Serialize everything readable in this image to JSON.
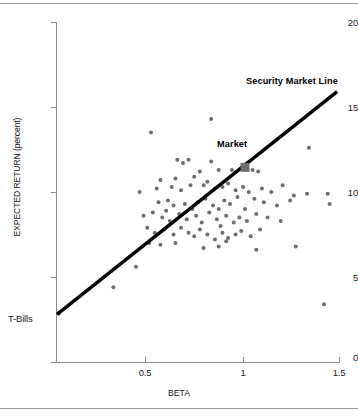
{
  "chart_data": {
    "type": "scatter",
    "title": "",
    "xlabel": "BETA",
    "ylabel": "EXPECTED RETURN (percent)",
    "xlim": [
      0,
      1.51
    ],
    "ylim": [
      0,
      20
    ],
    "xticks": [
      0.5,
      1,
      1.5
    ],
    "xticklabels": [
      "0.5",
      "1",
      "1.5"
    ],
    "yticks": [
      0,
      5,
      10,
      15,
      20
    ],
    "yticklabels": [
      "0",
      "5",
      "10",
      "15",
      "20"
    ],
    "grid": false,
    "legend": "none",
    "annotations": [
      {
        "text": "Security Market Line",
        "x": 1.05,
        "y": 16.9
      },
      {
        "text": "Market",
        "x": 0.86,
        "y": 13.1
      },
      {
        "text": "T-Bills",
        "x": 0.0,
        "y": 2.8
      }
    ],
    "series": [
      {
        "name": "Security Market Line",
        "type": "line",
        "x": [
          0.0,
          1.49
        ],
        "y": [
          2.8,
          15.9
        ],
        "intercept": 2.8,
        "slope": 8.8,
        "color": "#000000"
      },
      {
        "name": "Market portfolio",
        "type": "marker",
        "marker": "square",
        "x": [
          1.0
        ],
        "y": [
          11.45
        ],
        "color": "#6e6e6e"
      },
      {
        "name": "Individual securities",
        "type": "scatter",
        "marker": "circle",
        "color": "#6e6e6e",
        "points": [
          [
            0.5,
            13.5
          ],
          [
            0.82,
            14.3
          ],
          [
            1.34,
            12.6
          ],
          [
            0.64,
            11.9
          ],
          [
            0.7,
            11.9
          ],
          [
            0.82,
            11.8
          ],
          [
            0.67,
            11.7
          ],
          [
            0.55,
            10.7
          ],
          [
            0.63,
            10.8
          ],
          [
            0.73,
            10.9
          ],
          [
            0.76,
            11.2
          ],
          [
            0.86,
            11.3
          ],
          [
            0.93,
            11.3
          ],
          [
            1.04,
            11.3
          ],
          [
            1.07,
            11.2
          ],
          [
            0.44,
            10.0
          ],
          [
            0.53,
            10.2
          ],
          [
            0.61,
            10.3
          ],
          [
            0.66,
            10.1
          ],
          [
            0.71,
            10.4
          ],
          [
            0.78,
            10.4
          ],
          [
            0.8,
            10.6
          ],
          [
            0.84,
            10.2
          ],
          [
            0.88,
            10.3
          ],
          [
            0.91,
            10.5
          ],
          [
            0.95,
            10.1
          ],
          [
            0.99,
            10.3
          ],
          [
            1.02,
            10.0
          ],
          [
            1.09,
            10.2
          ],
          [
            1.14,
            10.0
          ],
          [
            1.2,
            10.4
          ],
          [
            1.26,
            9.8
          ],
          [
            1.33,
            9.9
          ],
          [
            1.44,
            9.9
          ],
          [
            0.54,
            9.4
          ],
          [
            0.59,
            9.5
          ],
          [
            0.62,
            9.2
          ],
          [
            0.68,
            9.3
          ],
          [
            0.72,
            9.0
          ],
          [
            0.75,
            9.4
          ],
          [
            0.79,
            9.6
          ],
          [
            0.83,
            9.2
          ],
          [
            0.86,
            9.0
          ],
          [
            0.89,
            9.5
          ],
          [
            0.92,
            9.3
          ],
          [
            0.96,
            9.7
          ],
          [
            1.0,
            9.0
          ],
          [
            1.05,
            9.6
          ],
          [
            1.1,
            9.4
          ],
          [
            1.17,
            9.2
          ],
          [
            1.24,
            9.5
          ],
          [
            1.45,
            9.3
          ],
          [
            0.46,
            8.6
          ],
          [
            0.51,
            8.8
          ],
          [
            0.56,
            8.5
          ],
          [
            0.58,
            8.9
          ],
          [
            0.6,
            8.3
          ],
          [
            0.65,
            8.7
          ],
          [
            0.69,
            8.4
          ],
          [
            0.74,
            8.6
          ],
          [
            0.77,
            8.2
          ],
          [
            0.81,
            8.8
          ],
          [
            0.85,
            8.4
          ],
          [
            0.87,
            8.0
          ],
          [
            0.9,
            8.6
          ],
          [
            0.94,
            8.2
          ],
          [
            0.97,
            8.5
          ],
          [
            1.01,
            8.3
          ],
          [
            1.06,
            8.7
          ],
          [
            1.12,
            8.5
          ],
          [
            1.19,
            8.3
          ],
          [
            0.48,
            7.9
          ],
          [
            0.52,
            7.6
          ],
          [
            0.57,
            7.8
          ],
          [
            0.62,
            7.5
          ],
          [
            0.66,
            7.9
          ],
          [
            0.7,
            7.6
          ],
          [
            0.73,
            7.4
          ],
          [
            0.76,
            7.8
          ],
          [
            0.8,
            7.5
          ],
          [
            0.84,
            7.2
          ],
          [
            0.88,
            7.6
          ],
          [
            0.91,
            7.3
          ],
          [
            0.95,
            7.5
          ],
          [
            0.98,
            7.7
          ],
          [
            1.03,
            7.4
          ],
          [
            1.08,
            7.8
          ],
          [
            0.49,
            7.0
          ],
          [
            0.55,
            6.9
          ],
          [
            0.63,
            7.0
          ],
          [
            0.78,
            6.7
          ],
          [
            0.86,
            6.8
          ],
          [
            0.9,
            7.1
          ],
          [
            1.06,
            6.6
          ],
          [
            1.27,
            6.8
          ],
          [
            0.42,
            5.6
          ],
          [
            0.3,
            4.4
          ],
          [
            1.42,
            3.4
          ],
          [
            0.01,
            2.85
          ]
        ]
      }
    ]
  },
  "axes": {
    "y_title": "EXPECTED RETURN (percent)",
    "x_title": "BETA",
    "tbills_label": "T-Bills"
  },
  "labels": {
    "sml": "Security Market Line",
    "market": "Market"
  }
}
